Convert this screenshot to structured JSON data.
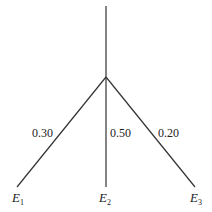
{
  "diagram": {
    "type": "probability-tree",
    "root_line": {
      "x": 106,
      "y_top": 6,
      "y_node": 77
    },
    "node": {
      "x": 106,
      "y": 77
    },
    "branches": [
      {
        "event": "E",
        "subscript": "1",
        "probability": "0.30",
        "end": {
          "x": 17,
          "y": 187
        }
      },
      {
        "event": "E",
        "subscript": "2",
        "probability": "0.50",
        "end": {
          "x": 106,
          "y": 187
        }
      },
      {
        "event": "E",
        "subscript": "3",
        "probability": "0.20",
        "end": {
          "x": 195,
          "y": 187
        }
      }
    ],
    "colors": {
      "line": "#333333",
      "text": "#222222",
      "background": "#ffffff"
    }
  }
}
